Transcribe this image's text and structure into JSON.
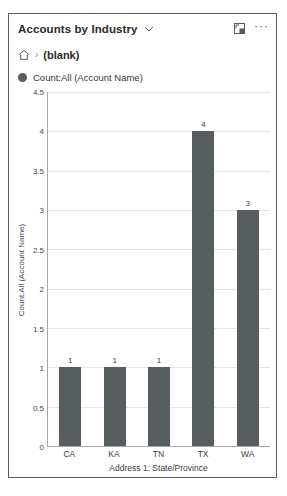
{
  "card": {
    "header": {
      "title": "Accounts by Industry",
      "chevron_icon": "chevron-down-icon",
      "expand_icon": "expand-icon",
      "more_icon": "ellipsis-icon",
      "more_label": "···"
    },
    "breadcrumb": {
      "home_icon": "home-icon",
      "separator": "›",
      "current": "(blank)"
    },
    "legend": {
      "items": [
        {
          "label": "Count:All (Account Name)",
          "color": "#595e60"
        }
      ]
    }
  },
  "chart_data": {
    "type": "bar",
    "title": "Accounts by Industry",
    "categories": [
      "CA",
      "KA",
      "TN",
      "TX",
      "WA"
    ],
    "values": [
      1,
      1,
      1,
      4,
      3
    ],
    "series": [
      {
        "name": "Count:All (Account Name)",
        "values": [
          1,
          1,
          1,
          4,
          3
        ],
        "color": "#575c5e"
      }
    ],
    "xlabel": "Address 1: State/Province",
    "ylabel": "Count:All (Account Name)",
    "ylim": [
      0,
      4.5
    ],
    "yticks": [
      0,
      0.5,
      1,
      1.5,
      2,
      2.5,
      3,
      3.5,
      4,
      4.5
    ],
    "ytick_labels": [
      "0",
      "0.5",
      "1",
      "1.5",
      "2",
      "2.5",
      "3",
      "3.5",
      "4",
      "4.5"
    ],
    "data_labels": [
      "1",
      "1",
      "1",
      "4",
      "3"
    ],
    "grid": true,
    "legend_position": "top-left"
  },
  "colors": {
    "bar": "#575c5e",
    "gridline": "#e6e6e6",
    "axis": "#a8a8a8",
    "card_border": "#5d5d5d"
  }
}
